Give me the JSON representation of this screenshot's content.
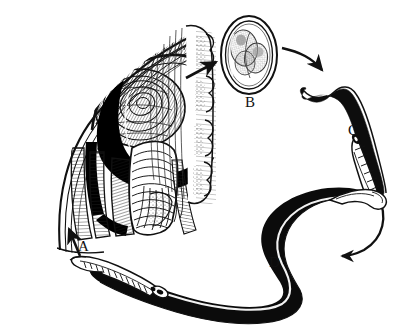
{
  "figure": {
    "kind": "life-cycle-diagram",
    "background_color": "#ffffff",
    "ink_color": "#111111",
    "width": 406,
    "height": 336,
    "style": "black-and-white pen-and-ink line drawing"
  },
  "stages": [
    {
      "id": "a",
      "label": "A",
      "name": "adult-worm-in-host-tissue",
      "description": "Cross-section of striated host tissue with a coiled adult worm embedded in it",
      "label_position": {
        "x": 78,
        "y": 239
      }
    },
    {
      "id": "b",
      "label": "B",
      "name": "egg",
      "description": "Oval thick-shelled egg containing a lobed developing embryo",
      "label_position": {
        "x": 245,
        "y": 95
      }
    },
    {
      "id": "c",
      "label": "C",
      "name": "larva",
      "description": "Small hooked larva with dark body and segmented stichosome tail",
      "label_position": {
        "x": 348,
        "y": 123
      }
    },
    {
      "id": "d",
      "label": "D",
      "name": "adult-worm",
      "description": "Large S-shaped adult worm with solid black body and pale head end",
      "label_position": {
        "x": 269,
        "y": 255
      }
    }
  ],
  "arrows": [
    {
      "name": "arrow-tissue-to-egg",
      "from": "A",
      "to": "B",
      "shape": "straight",
      "direction": "up-right"
    },
    {
      "name": "arrow-egg-to-larva",
      "from": "B",
      "to": "C",
      "shape": "curved",
      "direction": "down-right"
    },
    {
      "name": "arrow-larva-to-adult",
      "from": "C",
      "to": "D",
      "shape": "curved",
      "direction": "down-left"
    },
    {
      "name": "arrow-adult-to-tissue",
      "from": "D",
      "to": "A",
      "shape": "straight",
      "direction": "up"
    }
  ]
}
